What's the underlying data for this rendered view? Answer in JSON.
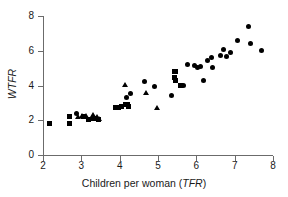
{
  "chart_data": {
    "type": "scatter",
    "title": "",
    "xlabel": "Children per woman (TFR)",
    "xlabel_plain": "Children per woman (",
    "xlabel_italic": "TFR",
    "xlabel_tail": ")",
    "ylabel": "WTFR",
    "xlim": [
      2,
      8
    ],
    "ylim": [
      0,
      8
    ],
    "xticks": [
      2,
      3,
      4,
      5,
      6,
      7,
      8
    ],
    "yticks": [
      0,
      2,
      4,
      6,
      8
    ],
    "grid": false,
    "legend": "none",
    "marker_color": "#000000",
    "axis_color": "#6b6b6b",
    "background": "#ffffff",
    "series": [
      {
        "name": "squares",
        "marker": "square",
        "points": [
          [
            2.18,
            1.82
          ],
          [
            2.7,
            2.22
          ],
          [
            2.7,
            1.82
          ],
          [
            3.05,
            2.22
          ],
          [
            3.18,
            2.02
          ],
          [
            3.33,
            2.1
          ],
          [
            3.44,
            2.02
          ],
          [
            3.9,
            2.72
          ],
          [
            3.98,
            2.74
          ],
          [
            4.06,
            2.8
          ],
          [
            4.14,
            2.88
          ],
          [
            4.2,
            2.92
          ],
          [
            4.22,
            2.8
          ],
          [
            5.42,
            4.82
          ],
          [
            5.46,
            4.78
          ],
          [
            5.44,
            4.46
          ],
          [
            5.46,
            4.26
          ],
          [
            5.58,
            3.98
          ]
        ]
      },
      {
        "name": "triangles",
        "marker": "triangle",
        "points": [
          [
            2.92,
            2.18
          ],
          [
            3.02,
            2.26
          ],
          [
            3.12,
            2.22
          ],
          [
            3.3,
            2.3
          ],
          [
            3.4,
            2.18
          ],
          [
            3.46,
            2.06
          ],
          [
            4.14,
            4.04
          ],
          [
            4.68,
            3.58
          ],
          [
            4.98,
            2.72
          ]
        ]
      },
      {
        "name": "circles",
        "marker": "circle",
        "points": [
          [
            2.88,
            2.4
          ],
          [
            4.18,
            3.3
          ],
          [
            4.28,
            3.56
          ],
          [
            4.66,
            4.22
          ],
          [
            4.92,
            3.96
          ],
          [
            5.34,
            3.44
          ],
          [
            5.66,
            4.02
          ],
          [
            5.78,
            5.22
          ],
          [
            5.96,
            5.14
          ],
          [
            6.02,
            5.02
          ],
          [
            6.12,
            5.08
          ],
          [
            6.18,
            4.26
          ],
          [
            6.3,
            5.46
          ],
          [
            6.4,
            5.6
          ],
          [
            6.42,
            5.02
          ],
          [
            6.62,
            5.74
          ],
          [
            6.7,
            6.1
          ],
          [
            6.78,
            5.66
          ],
          [
            6.88,
            5.88
          ],
          [
            7.08,
            6.6
          ],
          [
            7.36,
            7.42
          ],
          [
            7.4,
            6.4
          ],
          [
            7.7,
            6.02
          ]
        ]
      }
    ]
  }
}
